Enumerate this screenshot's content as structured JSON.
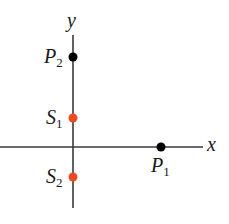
{
  "diagram": {
    "axes": {
      "x_label": "x",
      "y_label": "y",
      "color": "#3a3a3a"
    },
    "points": [
      {
        "name": "P",
        "sub": "2",
        "color": "#000000",
        "cx": 73,
        "cy": 57
      },
      {
        "name": "S",
        "sub": "1",
        "color": "#ee4a22",
        "cx": 73,
        "cy": 118
      },
      {
        "name": "S",
        "sub": "2",
        "color": "#ee4a22",
        "cx": 73,
        "cy": 177
      },
      {
        "name": "P",
        "sub": "1",
        "color": "#000000",
        "cx": 161,
        "cy": 147
      }
    ]
  }
}
